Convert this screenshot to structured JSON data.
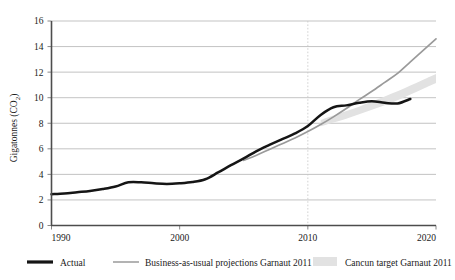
{
  "chart_data": {
    "type": "line",
    "title": "",
    "xlabel": "",
    "ylabel": "Gigatonnes (CO",
    "ylabel_sub": "2",
    "ylabel_tail": ")",
    "ylabel_full": "Gigatonnes (CO2)",
    "xlim": [
      1990,
      2020
    ],
    "ylim": [
      0,
      16
    ],
    "xticks": [
      1990,
      2000,
      2010,
      2020
    ],
    "yticks": [
      0,
      2,
      4,
      6,
      8,
      10,
      12,
      14,
      16
    ],
    "grid": "horizontal",
    "legend_position": "bottom",
    "annotations": [
      {
        "name": "year-2010-marker",
        "type": "vline",
        "x": 2010,
        "style": "dotted"
      }
    ],
    "series": [
      {
        "name": "Actual",
        "color": "#151515",
        "style": "solid-thick",
        "x": [
          1990,
          1991,
          1992,
          1993,
          1994,
          1995,
          1996,
          1997,
          1998,
          1999,
          2000,
          2001,
          2002,
          2003,
          2004,
          2005,
          2006,
          2007,
          2008,
          2009,
          2010,
          2011,
          2012,
          2013,
          2014,
          2015,
          2016,
          2017,
          2018
        ],
        "values": [
          2.45,
          2.5,
          2.6,
          2.7,
          2.85,
          3.05,
          3.38,
          3.38,
          3.3,
          3.25,
          3.3,
          3.4,
          3.62,
          4.15,
          4.72,
          5.25,
          5.82,
          6.3,
          6.75,
          7.2,
          7.78,
          8.65,
          9.25,
          9.4,
          9.6,
          9.72,
          9.6,
          9.55,
          9.9
        ]
      },
      {
        "name": "Business-as-usual projections Garnaut 2011",
        "color": "#9a9a9a",
        "style": "solid-thin",
        "x": [
          2005,
          2006,
          2007,
          2008,
          2009,
          2010,
          2011,
          2012,
          2013,
          2014,
          2015,
          2016,
          2017,
          2018,
          2019,
          2020
        ],
        "values": [
          5.1,
          5.5,
          5.95,
          6.4,
          6.85,
          7.35,
          7.9,
          8.5,
          9.15,
          9.85,
          10.5,
          11.2,
          11.9,
          12.8,
          13.7,
          14.6
        ]
      },
      {
        "name": "Cancun target Garnaut 2011",
        "color": "#e2e2e2",
        "style": "band",
        "x": [
          2011,
          2012,
          2013,
          2014,
          2015,
          2016,
          2017,
          2018,
          2019,
          2020
        ],
        "lower": [
          7.75,
          8.05,
          8.35,
          8.7,
          9.05,
          9.4,
          9.8,
          10.25,
          10.7,
          11.15
        ],
        "upper": [
          8.25,
          8.6,
          8.95,
          9.3,
          9.7,
          10.1,
          10.5,
          10.95,
          11.4,
          11.85
        ]
      }
    ],
    "legend": [
      {
        "label": "Actual",
        "swatch": "line-thick-black"
      },
      {
        "label": "Business-as-usual projections Garnaut 2011",
        "swatch": "line-thin-gray"
      },
      {
        "label": "Cancun target Garnaut 2011",
        "swatch": "band-lightgray"
      }
    ]
  },
  "colors": {
    "actual": "#151515",
    "bau": "#9a9a9a",
    "band": "#e2e2e2",
    "grid": "#b4b4b4",
    "axis": "#4d4d4d",
    "background": "#ffffff"
  }
}
